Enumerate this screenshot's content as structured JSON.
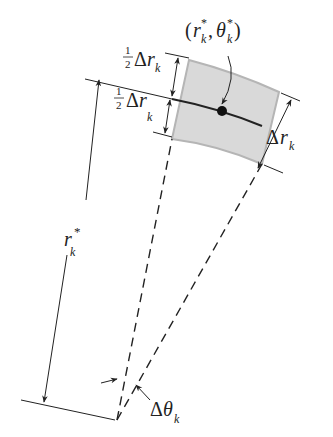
{
  "diagram": {
    "type": "polar-rectangle",
    "colors": {
      "line": "#222222",
      "shade_fill": "#d9d9d9",
      "shade_edge": "#b5b5b5",
      "background": "#ffffff"
    },
    "labels": {
      "point": {
        "open": "(",
        "r": "r",
        "r_sup": "*",
        "r_sub": "k",
        "comma": ",",
        "theta": "θ",
        "theta_sup": "*",
        "theta_sub": "k",
        "close": ")"
      },
      "half_top": {
        "num": "1",
        "den": "2",
        "delta": "Δ",
        "var": "r",
        "sub": "k"
      },
      "half_bottom": {
        "num": "1",
        "den": "2",
        "delta": "Δ",
        "var": "r",
        "sub": "k"
      },
      "delta_r": {
        "delta": "Δ",
        "var": "r",
        "sub": "k"
      },
      "radius": {
        "var": "r",
        "sup": "*",
        "sub": "k"
      },
      "delta_theta": {
        "delta": "Δ",
        "var": "θ",
        "sub": "k"
      }
    }
  }
}
